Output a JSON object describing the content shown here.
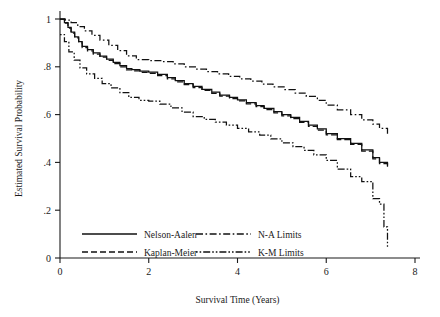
{
  "chart_data": {
    "type": "line",
    "title": "",
    "subtitle": "",
    "xlabel": "Survival Time (Years)",
    "ylabel": "Estimated Survival Probability",
    "xlim": [
      0,
      8
    ],
    "ylim": [
      0,
      1
    ],
    "grid": false,
    "step_plot": true,
    "legend_position": "inside-bottom-left",
    "xticks": [
      0,
      2,
      4,
      6,
      8
    ],
    "xtick_labels": [
      "0",
      "2",
      "4",
      "6",
      "8"
    ],
    "yticks": [
      0,
      0.2,
      0.4,
      0.6,
      0.8,
      1
    ],
    "ytick_labels": [
      "0",
      ".2",
      ".4",
      ".6",
      ".8",
      "1"
    ],
    "series": [
      {
        "name": "Nelson-Aalen",
        "style": "solid",
        "color": "#111111",
        "x": [
          0.0,
          0.1,
          0.18,
          0.25,
          0.33,
          0.42,
          0.5,
          0.62,
          0.75,
          0.9,
          1.05,
          1.2,
          1.35,
          1.5,
          1.62,
          1.8,
          2.0,
          2.2,
          2.42,
          2.6,
          2.8,
          3.0,
          3.2,
          3.42,
          3.6,
          3.82,
          4.0,
          4.2,
          4.42,
          4.6,
          4.82,
          5.0,
          5.2,
          5.4,
          5.6,
          5.8,
          6.0,
          6.25,
          6.55,
          6.8,
          7.05,
          7.2,
          7.38
        ],
        "y": [
          1.0,
          0.985,
          0.965,
          0.945,
          0.925,
          0.905,
          0.885,
          0.872,
          0.858,
          0.845,
          0.832,
          0.818,
          0.805,
          0.792,
          0.788,
          0.782,
          0.778,
          0.768,
          0.755,
          0.742,
          0.73,
          0.718,
          0.706,
          0.694,
          0.682,
          0.672,
          0.662,
          0.65,
          0.638,
          0.626,
          0.612,
          0.6,
          0.588,
          0.572,
          0.556,
          0.54,
          0.52,
          0.5,
          0.48,
          0.452,
          0.42,
          0.4,
          0.382
        ]
      },
      {
        "name": "Kaplan-Meier",
        "style": "dashed",
        "color": "#111111",
        "x": [
          0.0,
          0.1,
          0.18,
          0.25,
          0.33,
          0.42,
          0.5,
          0.62,
          0.75,
          0.9,
          1.05,
          1.2,
          1.35,
          1.5,
          1.62,
          1.8,
          2.0,
          2.2,
          2.42,
          2.6,
          2.8,
          3.0,
          3.2,
          3.42,
          3.6,
          3.82,
          4.0,
          4.2,
          4.42,
          4.6,
          4.82,
          5.0,
          5.2,
          5.4,
          5.6,
          5.8,
          6.0,
          6.25,
          6.55,
          6.8,
          7.05,
          7.2,
          7.38
        ],
        "y": [
          1.0,
          0.983,
          0.962,
          0.941,
          0.921,
          0.9,
          0.88,
          0.867,
          0.853,
          0.84,
          0.827,
          0.813,
          0.8,
          0.787,
          0.783,
          0.777,
          0.773,
          0.763,
          0.75,
          0.737,
          0.725,
          0.713,
          0.701,
          0.689,
          0.677,
          0.667,
          0.657,
          0.645,
          0.633,
          0.621,
          0.607,
          0.595,
          0.583,
          0.567,
          0.551,
          0.535,
          0.515,
          0.495,
          0.475,
          0.447,
          0.415,
          0.395,
          0.377
        ]
      },
      {
        "name": "N-A Limits",
        "style": "dash-dot",
        "color": "#111111",
        "band": "upper",
        "x": [
          0.0,
          0.12,
          0.25,
          0.4,
          0.55,
          0.72,
          0.9,
          1.1,
          1.3,
          1.5,
          1.72,
          2.0,
          2.3,
          2.55,
          2.8,
          3.05,
          3.3,
          3.55,
          3.8,
          4.05,
          4.3,
          4.55,
          4.8,
          5.05,
          5.3,
          5.55,
          5.8,
          6.0,
          6.25,
          6.55,
          6.8,
          7.05,
          7.2,
          7.38
        ],
        "y": [
          1.0,
          0.995,
          0.985,
          0.968,
          0.95,
          0.932,
          0.912,
          0.89,
          0.868,
          0.846,
          0.83,
          0.826,
          0.822,
          0.812,
          0.8,
          0.79,
          0.78,
          0.77,
          0.76,
          0.75,
          0.74,
          0.728,
          0.716,
          0.704,
          0.69,
          0.676,
          0.66,
          0.64,
          0.62,
          0.6,
          0.578,
          0.56,
          0.542,
          0.52
        ]
      },
      {
        "name": "K-M Limits",
        "style": "dotted",
        "color": "#111111",
        "band": "lower",
        "x": [
          0.0,
          0.1,
          0.2,
          0.32,
          0.45,
          0.6,
          0.78,
          0.95,
          1.15,
          1.35,
          1.55,
          1.78,
          2.0,
          2.25,
          2.5,
          2.75,
          3.0,
          3.25,
          3.5,
          3.75,
          4.0,
          4.25,
          4.5,
          4.75,
          5.0,
          5.25,
          5.5,
          5.72,
          6.0,
          6.25,
          6.55,
          6.8,
          7.05,
          7.2,
          7.3,
          7.38
        ],
        "y": [
          0.935,
          0.905,
          0.862,
          0.828,
          0.795,
          0.77,
          0.752,
          0.73,
          0.712,
          0.692,
          0.672,
          0.66,
          0.656,
          0.644,
          0.628,
          0.61,
          0.592,
          0.58,
          0.568,
          0.556,
          0.542,
          0.528,
          0.514,
          0.498,
          0.482,
          0.466,
          0.45,
          0.432,
          0.408,
          0.372,
          0.34,
          0.32,
          0.248,
          0.225,
          0.13,
          0.045
        ]
      }
    ],
    "legend_entries": [
      {
        "label": "Nelson-Aalen",
        "style": "solid"
      },
      {
        "label": "Kaplan-Meier",
        "style": "dashed"
      },
      {
        "label": "N-A Limits",
        "style": "dash-dot"
      },
      {
        "label": "K-M Limits",
        "style": "dotted"
      }
    ]
  }
}
